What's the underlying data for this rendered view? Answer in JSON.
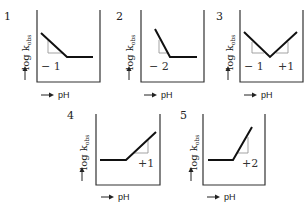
{
  "diagram": {
    "y_axis_label": "log k",
    "y_axis_subscript": "obs",
    "x_axis_label": "pH",
    "panels": [
      {
        "id": "1",
        "label": "1",
        "slopes": [
          "− 1"
        ],
        "description": "slope -1 then plateau"
      },
      {
        "id": "2",
        "label": "2",
        "slopes": [
          "− 2"
        ],
        "description": "slope -2 then plateau"
      },
      {
        "id": "3",
        "label": "3",
        "slopes": [
          "− 1",
          "+1"
        ],
        "description": "V-shape: slope -1 then +1"
      },
      {
        "id": "4",
        "label": "4",
        "slopes": [
          "+1"
        ],
        "description": "plateau then slope +1"
      },
      {
        "id": "5",
        "label": "5",
        "slopes": [
          "+2"
        ],
        "description": "plateau then slope +2"
      }
    ]
  }
}
